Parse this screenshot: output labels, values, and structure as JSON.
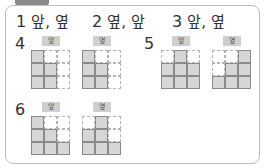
{
  "answers": [
    {
      "num": "1",
      "text": "앞, 옆"
    },
    {
      "num": "2",
      "text": "옆, 앞"
    },
    {
      "num": "3",
      "text": "앞, 옆"
    }
  ],
  "problems": [
    {
      "num": "4",
      "front_label": "앞",
      "side_label": "옆",
      "front_grid": [
        "f..",
        "ff.",
        "ff."
      ],
      "side_grid": [
        "f..",
        "ff.",
        "ff."
      ]
    },
    {
      "num": "5",
      "front_label": "앞",
      "side_label": "옆",
      "front_grid": [
        ".f.",
        "fff",
        "fff"
      ],
      "side_grid": [
        "..f",
        ".ff",
        "fff"
      ]
    },
    {
      "num": "6",
      "front_label": "앞",
      "side_label": "옆",
      "front_grid": [
        "f..",
        "ff.",
        "fff"
      ],
      "side_grid": [
        ".f.",
        "ff.",
        "fff"
      ]
    }
  ],
  "colors": {
    "filled": "#d6d6d6",
    "border": "#8a8a8a",
    "tab": "#8a8a8a"
  }
}
